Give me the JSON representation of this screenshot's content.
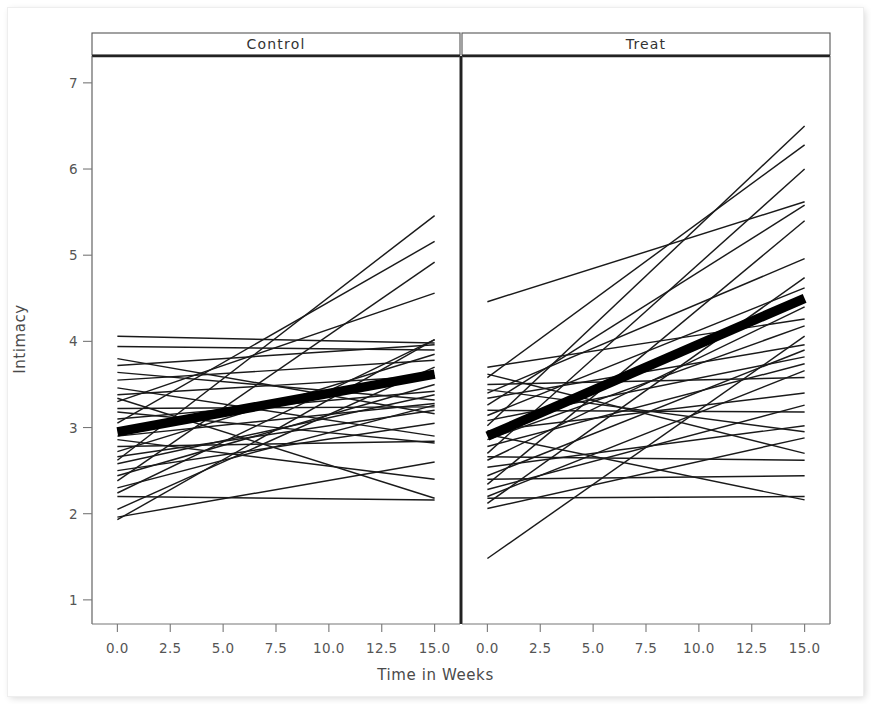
{
  "chart_data": {
    "type": "line",
    "title": "",
    "subtitle": "",
    "xlabel": "Time in Weeks",
    "ylabel": "Intimacy",
    "xlim": [
      -1.2,
      16.2
    ],
    "ylim": [
      0.72,
      7.3
    ],
    "xticks": [
      "0.0",
      "2.5",
      "5.0",
      "7.5",
      "10.0",
      "12.5",
      "15.0"
    ],
    "xtick_values": [
      0.0,
      2.5,
      5.0,
      7.5,
      10.0,
      12.5,
      15.0
    ],
    "yticks": [
      "1",
      "2",
      "3",
      "4",
      "5",
      "6",
      "7"
    ],
    "ytick_values": [
      1,
      2,
      3,
      4,
      5,
      6,
      7
    ],
    "grid": false,
    "legend": "none",
    "line_color": "#1a1a1a",
    "mean_line_color": "#000000",
    "panel_layout": "1x2-trellis",
    "x_domain": [
      0,
      15
    ],
    "panels": [
      {
        "name": "control",
        "strip_label": "Control",
        "mean_series": {
          "name": "Control mean",
          "x": [
            0,
            15
          ],
          "y": [
            2.95,
            3.62
          ],
          "emphasis": "thick"
        },
        "series": [
          {
            "name": "c01",
            "x": [
              0,
              15
            ],
            "y": [
              2.62,
              5.46
            ]
          },
          {
            "name": "c02",
            "x": [
              0,
              15
            ],
            "y": [
              3.05,
              5.16
            ]
          },
          {
            "name": "c03",
            "x": [
              0,
              15
            ],
            "y": [
              2.38,
              4.92
            ]
          },
          {
            "name": "c04",
            "x": [
              0,
              15
            ],
            "y": [
              3.3,
              4.56
            ]
          },
          {
            "name": "c05",
            "x": [
              0,
              15
            ],
            "y": [
              1.93,
              4.02
            ]
          },
          {
            "name": "c06",
            "x": [
              0,
              15
            ],
            "y": [
              2.24,
              4.02
            ]
          },
          {
            "name": "c07",
            "x": [
              0,
              15
            ],
            "y": [
              4.06,
              3.98
            ]
          },
          {
            "name": "c08",
            "x": [
              0,
              15
            ],
            "y": [
              3.72,
              3.96
            ]
          },
          {
            "name": "c09",
            "x": [
              0,
              15
            ],
            "y": [
              3.94,
              3.9
            ]
          },
          {
            "name": "c10",
            "x": [
              0,
              15
            ],
            "y": [
              2.72,
              3.85
            ]
          },
          {
            "name": "c11",
            "x": [
              0,
              15
            ],
            "y": [
              3.55,
              3.78
            ]
          },
          {
            "name": "c12",
            "x": [
              0,
              15
            ],
            "y": [
              2.05,
              3.7
            ]
          },
          {
            "name": "c13",
            "x": [
              0,
              15
            ],
            "y": [
              3.38,
              3.6
            ]
          },
          {
            "name": "c14",
            "x": [
              0,
              15
            ],
            "y": [
              2.44,
              3.5
            ]
          },
          {
            "name": "c15",
            "x": [
              0,
              15
            ],
            "y": [
              3.1,
              3.42
            ]
          },
          {
            "name": "c16",
            "x": [
              0,
              15
            ],
            "y": [
              2.58,
              3.38
            ]
          },
          {
            "name": "c17",
            "x": [
              0,
              15
            ],
            "y": [
              3.64,
              3.32
            ]
          },
          {
            "name": "c18",
            "x": [
              0,
              15
            ],
            "y": [
              2.9,
              3.28
            ]
          },
          {
            "name": "c19",
            "x": [
              0,
              15
            ],
            "y": [
              2.3,
              3.26
            ]
          },
          {
            "name": "c20",
            "x": [
              0,
              15
            ],
            "y": [
              3.22,
              3.24
            ]
          },
          {
            "name": "c21",
            "x": [
              0,
              15
            ],
            "y": [
              2.66,
              3.2
            ]
          },
          {
            "name": "c22",
            "x": [
              0,
              15
            ],
            "y": [
              3.8,
              3.16
            ]
          },
          {
            "name": "c23",
            "x": [
              0,
              15
            ],
            "y": [
              2.5,
              3.05
            ]
          },
          {
            "name": "c24",
            "x": [
              0,
              15
            ],
            "y": [
              3.46,
              2.9
            ]
          },
          {
            "name": "c25",
            "x": [
              0,
              15
            ],
            "y": [
              2.78,
              2.84
            ]
          },
          {
            "name": "c26",
            "x": [
              0,
              15
            ],
            "y": [
              3.18,
              2.82
            ]
          },
          {
            "name": "c27",
            "x": [
              0,
              15
            ],
            "y": [
              1.96,
              2.6
            ]
          },
          {
            "name": "c28",
            "x": [
              0,
              15
            ],
            "y": [
              2.86,
              2.4
            ]
          },
          {
            "name": "c29",
            "x": [
              0,
              15
            ],
            "y": [
              3.34,
              2.18
            ]
          },
          {
            "name": "c30",
            "x": [
              0,
              15
            ],
            "y": [
              2.2,
              2.16
            ]
          }
        ]
      },
      {
        "name": "treat",
        "strip_label": "Treat",
        "mean_series": {
          "name": "Treat mean",
          "x": [
            0,
            15
          ],
          "y": [
            2.9,
            4.5
          ],
          "emphasis": "thick"
        },
        "series": [
          {
            "name": "t01",
            "x": [
              0,
              15
            ],
            "y": [
              3.02,
              6.5
            ]
          },
          {
            "name": "t02",
            "x": [
              0,
              15
            ],
            "y": [
              3.58,
              6.28
            ]
          },
          {
            "name": "t03",
            "x": [
              0,
              15
            ],
            "y": [
              2.7,
              6.0
            ]
          },
          {
            "name": "t04",
            "x": [
              0,
              15
            ],
            "y": [
              4.46,
              5.62
            ]
          },
          {
            "name": "t05",
            "x": [
              0,
              15
            ],
            "y": [
              3.26,
              5.58
            ]
          },
          {
            "name": "t06",
            "x": [
              0,
              15
            ],
            "y": [
              2.34,
              5.4
            ]
          },
          {
            "name": "t07",
            "x": [
              0,
              15
            ],
            "y": [
              3.4,
              4.96
            ]
          },
          {
            "name": "t08",
            "x": [
              0,
              15
            ],
            "y": [
              2.12,
              4.74
            ]
          },
          {
            "name": "t09",
            "x": [
              0,
              15
            ],
            "y": [
              3.14,
              4.62
            ]
          },
          {
            "name": "t10",
            "x": [
              0,
              15
            ],
            "y": [
              2.62,
              4.4
            ]
          },
          {
            "name": "t11",
            "x": [
              0,
              15
            ],
            "y": [
              3.7,
              4.26
            ]
          },
          {
            "name": "t12",
            "x": [
              0,
              15
            ],
            "y": [
              2.86,
              4.18
            ]
          },
          {
            "name": "t13",
            "x": [
              0,
              15
            ],
            "y": [
              1.48,
              4.06
            ]
          },
          {
            "name": "t14",
            "x": [
              0,
              15
            ],
            "y": [
              3.34,
              3.96
            ]
          },
          {
            "name": "t15",
            "x": [
              0,
              15
            ],
            "y": [
              2.44,
              3.9
            ]
          },
          {
            "name": "t16",
            "x": [
              0,
              15
            ],
            "y": [
              3.08,
              3.82
            ]
          },
          {
            "name": "t17",
            "x": [
              0,
              15
            ],
            "y": [
              2.78,
              3.74
            ]
          },
          {
            "name": "t18",
            "x": [
              0,
              15
            ],
            "y": [
              2.2,
              3.66
            ]
          },
          {
            "name": "t19",
            "x": [
              0,
              15
            ],
            "y": [
              3.5,
              3.58
            ]
          },
          {
            "name": "t20",
            "x": [
              0,
              15
            ],
            "y": [
              2.96,
              3.4
            ]
          },
          {
            "name": "t21",
            "x": [
              0,
              15
            ],
            "y": [
              2.28,
              3.26
            ]
          },
          {
            "name": "t22",
            "x": [
              0,
              15
            ],
            "y": [
              3.2,
              3.18
            ]
          },
          {
            "name": "t23",
            "x": [
              0,
              15
            ],
            "y": [
              2.54,
              3.02
            ]
          },
          {
            "name": "t24",
            "x": [
              0,
              15
            ],
            "y": [
              3.44,
              2.95
            ]
          },
          {
            "name": "t25",
            "x": [
              0,
              15
            ],
            "y": [
              2.06,
              2.88
            ]
          },
          {
            "name": "t26",
            "x": [
              0,
              15
            ],
            "y": [
              3.62,
              2.7
            ]
          },
          {
            "name": "t27",
            "x": [
              0,
              15
            ],
            "y": [
              2.66,
              2.62
            ]
          },
          {
            "name": "t28",
            "x": [
              0,
              15
            ],
            "y": [
              2.4,
              2.44
            ]
          },
          {
            "name": "t29",
            "x": [
              0,
              15
            ],
            "y": [
              2.18,
              2.2
            ]
          },
          {
            "name": "t30",
            "x": [
              0,
              15
            ],
            "y": [
              2.92,
              2.16
            ]
          }
        ]
      }
    ]
  }
}
